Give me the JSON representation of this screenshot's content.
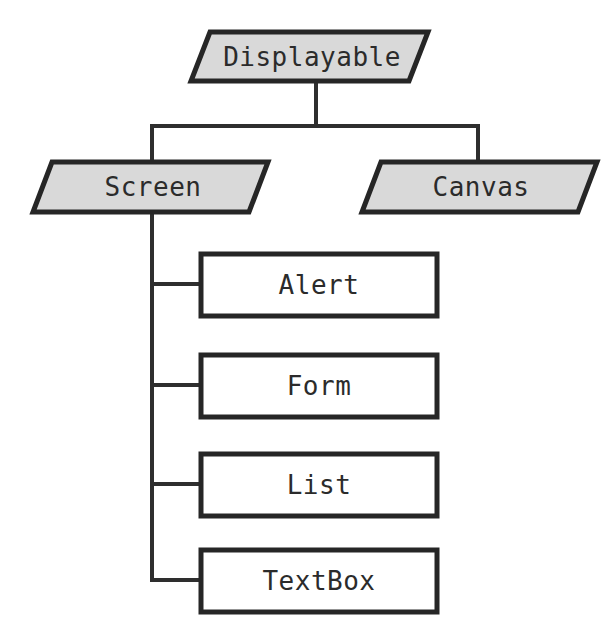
{
  "diagram": {
    "type": "class-hierarchy-tree",
    "colors": {
      "parallelogram_fill": "#d9d9d9",
      "rectangle_fill": "#ffffff",
      "border": "#262626",
      "connector": "#2e2e2e",
      "text": "#2b2b2b",
      "background": "#ffffff"
    },
    "root": {
      "label": "Displayable",
      "shape": "parallelogram"
    },
    "level2": [
      {
        "label": "Screen",
        "shape": "parallelogram"
      },
      {
        "label": "Canvas",
        "shape": "parallelogram"
      }
    ],
    "screen_children": [
      {
        "label": "Alert",
        "shape": "rectangle"
      },
      {
        "label": "Form",
        "shape": "rectangle"
      },
      {
        "label": "List",
        "shape": "rectangle"
      },
      {
        "label": "TextBox",
        "shape": "rectangle"
      }
    ]
  }
}
